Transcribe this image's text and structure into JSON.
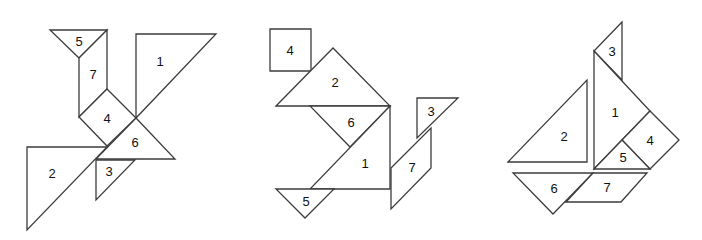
{
  "figures": [
    {
      "name": "bird",
      "pieces": [
        {
          "label": "5",
          "shape": "triangle",
          "points": "50,30 107,30 79,58",
          "label_pos": [
            79,
            41
          ]
        },
        {
          "label": "7",
          "shape": "parallelogram",
          "points": "79,58 107,30 107,89 79,117",
          "label_pos": [
            93,
            74
          ]
        },
        {
          "label": "4",
          "shape": "square",
          "points": "79,117 107,89 136,118 107,146",
          "label_pos": [
            107,
            118
          ]
        },
        {
          "label": "1",
          "shape": "triangle",
          "points": "136,34 216,34 136,118",
          "label_pos": [
            160,
            61
          ]
        },
        {
          "label": "6",
          "shape": "triangle",
          "points": "136,118 175,159 96,159",
          "label_pos": [
            135,
            142
          ]
        },
        {
          "label": "3",
          "shape": "triangle",
          "points": "96,160 135,160 96,200",
          "label_pos": [
            109,
            171
          ]
        },
        {
          "label": "2",
          "shape": "triangle",
          "points": "27,147 107,147 27,230",
          "label_pos": [
            52,
            173
          ]
        }
      ]
    },
    {
      "name": "cat",
      "pieces": [
        {
          "label": "4",
          "shape": "square",
          "points": "270,29 311,29 311,71 270,71",
          "label_pos": [
            290,
            50
          ]
        },
        {
          "label": "2",
          "shape": "triangle",
          "points": "276,106 333,48 390,106",
          "label_pos": [
            335,
            82
          ]
        },
        {
          "label": "6",
          "shape": "triangle",
          "points": "310,106 390,106 350,147",
          "label_pos": [
            351,
            122
          ]
        },
        {
          "label": "1",
          "shape": "triangle",
          "points": "390,106 390,189 310,189",
          "label_pos": [
            365,
            163
          ]
        },
        {
          "label": "5",
          "shape": "triangle",
          "points": "276,189 334,189 305,218",
          "label_pos": [
            306,
            201
          ]
        },
        {
          "label": "7",
          "shape": "parallelogram",
          "points": "391,168 431,128 431,168 391,209",
          "label_pos": [
            412,
            167
          ]
        },
        {
          "label": "3",
          "shape": "triangle",
          "points": "417,98 458,98 417,138",
          "label_pos": [
            431,
            111
          ]
        }
      ]
    },
    {
      "name": "sailboat",
      "pieces": [
        {
          "label": "3",
          "shape": "triangle",
          "points": "622,22 594,51 622,80",
          "label_pos": [
            612,
            51
          ]
        },
        {
          "label": "1",
          "shape": "triangle",
          "points": "594,51 650,111 594,169",
          "label_pos": [
            615,
            112
          ]
        },
        {
          "label": "4",
          "shape": "square",
          "points": "622,140 650,111 679,140 650,169",
          "label_pos": [
            650,
            140
          ]
        },
        {
          "label": "5",
          "shape": "triangle",
          "points": "594,169 622,140 650,169",
          "label_pos": [
            623,
            157
          ]
        },
        {
          "label": "2",
          "shape": "triangle",
          "points": "508,162 587,80 587,162",
          "label_pos": [
            564,
            136
          ]
        },
        {
          "label": "6",
          "shape": "triangle",
          "points": "513,173 593,173 553,214",
          "label_pos": [
            554,
            188
          ]
        },
        {
          "label": "7",
          "shape": "parallelogram",
          "points": "593,173 647,173 621,202 566,202",
          "label_pos": [
            607,
            187
          ]
        }
      ]
    }
  ]
}
